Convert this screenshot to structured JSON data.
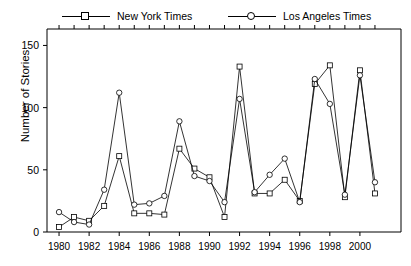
{
  "chart_data": {
    "type": "line",
    "title": "",
    "xlabel": "",
    "ylabel": "Number of Stories",
    "xlim": [
      1979.2,
      2001.8
    ],
    "ylim": [
      0,
      160
    ],
    "grid": false,
    "legend_position": "top",
    "y_ticks": [
      0,
      50,
      100,
      150
    ],
    "x_ticks": [
      1980,
      1982,
      1984,
      1986,
      1988,
      1990,
      1992,
      1994,
      1996,
      1998,
      2000
    ],
    "x": [
      1980,
      1981,
      1982,
      1983,
      1984,
      1985,
      1986,
      1987,
      1988,
      1989,
      1990,
      1991,
      1992,
      1993,
      1994,
      1995,
      1996,
      1997,
      1998,
      1999,
      2000,
      2001
    ],
    "series": [
      {
        "name": "New York Times",
        "marker": "square",
        "values": [
          4,
          12,
          9,
          21,
          61,
          15,
          15,
          14,
          67,
          51,
          44,
          12,
          133,
          31,
          31,
          42,
          25,
          119,
          134,
          28,
          130,
          31
        ]
      },
      {
        "name": "Los Angeles Times",
        "marker": "circle",
        "values": [
          16,
          8,
          6,
          34,
          112,
          22,
          23,
          29,
          89,
          45,
          41,
          24,
          107,
          32,
          46,
          59,
          24,
          123,
          103,
          30,
          126,
          40
        ]
      }
    ]
  },
  "legend": {
    "entries": [
      {
        "label": "New York Times",
        "marker": "square"
      },
      {
        "label": "Los Angeles Times",
        "marker": "circle"
      }
    ]
  },
  "axes": {
    "y_title": "Number of Stories",
    "y_tick_labels": [
      "0",
      "50",
      "100",
      "150"
    ],
    "x_tick_labels": [
      "1980",
      "1982",
      "1984",
      "1986",
      "1988",
      "1990",
      "1992",
      "1994",
      "1996",
      "1998",
      "2000"
    ]
  },
  "style": {
    "line_color": "#000000",
    "marker_fill": "#ffffff",
    "axis_color": "#000000",
    "background": "#ffffff"
  }
}
